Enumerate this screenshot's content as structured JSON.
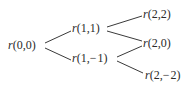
{
  "diagram": {
    "type": "binomial-tree",
    "nodes": [
      {
        "id": "n00",
        "fn": "r",
        "args": "(0,0)",
        "x": 8,
        "y": 39
      },
      {
        "id": "n11",
        "fn": "r",
        "args": "(1,1)",
        "x": 72,
        "y": 22
      },
      {
        "id": "n1m1",
        "fn": "r",
        "args": "(1,− 1)",
        "x": 72,
        "y": 52
      },
      {
        "id": "n22",
        "fn": "r",
        "args": "(2,2)",
        "x": 143,
        "y": 8
      },
      {
        "id": "n20",
        "fn": "r",
        "args": "(2,0)",
        "x": 143,
        "y": 37
      },
      {
        "id": "n2m2",
        "fn": "r",
        "args": "(2,− 2)",
        "x": 145,
        "y": 69
      }
    ],
    "edges": [
      {
        "from": "n00",
        "to": "n11",
        "x1": 45,
        "y1": 43,
        "x2": 71,
        "y2": 31
      },
      {
        "from": "n00",
        "to": "n1m1",
        "x1": 45,
        "y1": 48,
        "x2": 71,
        "y2": 60
      },
      {
        "from": "n11",
        "to": "n22",
        "x1": 107,
        "y1": 27,
        "x2": 142,
        "y2": 16
      },
      {
        "from": "n11",
        "to": "n20",
        "x1": 107,
        "y1": 31,
        "x2": 142,
        "y2": 41
      },
      {
        "from": "n1m1",
        "to": "n20",
        "x1": 117,
        "y1": 57,
        "x2": 142,
        "y2": 46
      },
      {
        "from": "n1m1",
        "to": "n2m2",
        "x1": 117,
        "y1": 61,
        "x2": 143,
        "y2": 73
      }
    ]
  }
}
